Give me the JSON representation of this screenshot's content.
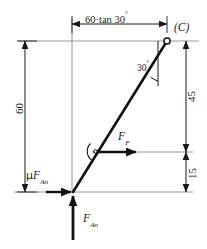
{
  "figure": {
    "type": "free-body-diagram",
    "background": "#ffffff",
    "line_color": "#1a1a1a",
    "thin_line_color": "#8c8c8c",
    "dimensions": {
      "top_horizontal": {
        "label": "60·tan 30",
        "label_degree": "°",
        "value": "60·tan 30°",
        "orientation": "horizontal"
      },
      "left_vertical": {
        "label": "60",
        "value": 60,
        "orientation": "vertical"
      },
      "right_upper": {
        "label": "45",
        "value": 45,
        "orientation": "vertical"
      },
      "right_lower": {
        "label": "15",
        "value": 15,
        "orientation": "vertical"
      }
    },
    "angles": {
      "at_point_c": {
        "label": "30",
        "degree_symbol": "°",
        "value": "30°",
        "between": "inclined-member and vertical reference"
      },
      "at_force_ff": {
        "label": "",
        "marker": "angle-arc-with-dot"
      }
    },
    "nodes": {
      "point_c": {
        "label": "(C)",
        "style": "open-circle"
      },
      "point_a": {
        "label": "",
        "style": "junction"
      }
    },
    "forces": [
      {
        "name": "friction-force",
        "symbol_prefix": "μ",
        "symbol": "F",
        "subscript": "An",
        "full_label": "μ F_An",
        "direction": "horizontal-right",
        "applied_at": "point-a"
      },
      {
        "name": "applied-force",
        "symbol_prefix": "",
        "symbol": "F",
        "subscript": "F",
        "full_label": "F_F",
        "direction": "horizontal-right",
        "applied_at": "mid-member"
      },
      {
        "name": "normal-force",
        "symbol_prefix": "",
        "symbol": "F",
        "subscript": "An",
        "full_label": "F_An",
        "direction": "vertical-up",
        "applied_at": "point-a"
      }
    ]
  }
}
